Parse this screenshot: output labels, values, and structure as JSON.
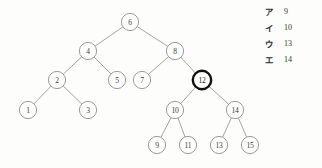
{
  "figure": {
    "kind": "binary-search-tree-diagram",
    "edge_color": "#8c8c8c",
    "node_stroke_color": "#8f8f8f",
    "node_fill_color": "#ffffff",
    "highlight_stroke_color": "#101010",
    "background_color": "#fdfdfc"
  },
  "tree": {
    "nodes": [
      {
        "id": "n6",
        "label": "6",
        "cx": 130,
        "cy": 22,
        "r": 8.6,
        "highlighted": false
      },
      {
        "id": "n4",
        "label": "4",
        "cx": 88,
        "cy": 51,
        "r": 8.6,
        "highlighted": false
      },
      {
        "id": "n8",
        "label": "8",
        "cx": 175,
        "cy": 51,
        "r": 8.6,
        "highlighted": false
      },
      {
        "id": "n2",
        "label": "2",
        "cx": 57,
        "cy": 80,
        "r": 8.6,
        "highlighted": false
      },
      {
        "id": "n5",
        "label": "5",
        "cx": 117,
        "cy": 80,
        "r": 8.6,
        "highlighted": false
      },
      {
        "id": "n7",
        "label": "7",
        "cx": 142,
        "cy": 80,
        "r": 8.6,
        "highlighted": false
      },
      {
        "id": "n12",
        "label": "12",
        "cx": 202,
        "cy": 80,
        "r": 9.2,
        "highlighted": true
      },
      {
        "id": "n1",
        "label": "1",
        "cx": 28,
        "cy": 110,
        "r": 8.6,
        "highlighted": false
      },
      {
        "id": "n3",
        "label": "3",
        "cx": 88,
        "cy": 110,
        "r": 8.6,
        "highlighted": false
      },
      {
        "id": "n10",
        "label": "10",
        "cx": 175,
        "cy": 110,
        "r": 8.6,
        "highlighted": false
      },
      {
        "id": "n14",
        "label": "14",
        "cx": 235,
        "cy": 110,
        "r": 8.6,
        "highlighted": false
      },
      {
        "id": "n9",
        "label": "9",
        "cx": 157,
        "cy": 145,
        "r": 8.6,
        "highlighted": false
      },
      {
        "id": "n11",
        "label": "11",
        "cx": 188,
        "cy": 145,
        "r": 8.6,
        "highlighted": false
      },
      {
        "id": "n13",
        "label": "13",
        "cx": 219,
        "cy": 145,
        "r": 8.6,
        "highlighted": false
      },
      {
        "id": "n15",
        "label": "15",
        "cx": 250,
        "cy": 145,
        "r": 8.6,
        "highlighted": false
      }
    ],
    "edges": [
      {
        "from": "n6",
        "to": "n4"
      },
      {
        "from": "n6",
        "to": "n8"
      },
      {
        "from": "n4",
        "to": "n2"
      },
      {
        "from": "n4",
        "to": "n5"
      },
      {
        "from": "n8",
        "to": "n7"
      },
      {
        "from": "n8",
        "to": "n12"
      },
      {
        "from": "n2",
        "to": "n1"
      },
      {
        "from": "n2",
        "to": "n3"
      },
      {
        "from": "n12",
        "to": "n10"
      },
      {
        "from": "n12",
        "to": "n14"
      },
      {
        "from": "n10",
        "to": "n9"
      },
      {
        "from": "n10",
        "to": "n11"
      },
      {
        "from": "n14",
        "to": "n13"
      },
      {
        "from": "n14",
        "to": "n15"
      }
    ]
  },
  "legend": {
    "rows": [
      {
        "key": "ア",
        "value": "9"
      },
      {
        "key": "イ",
        "value": "10"
      },
      {
        "key": "ウ",
        "value": "13"
      },
      {
        "key": "エ",
        "value": "14"
      }
    ]
  }
}
